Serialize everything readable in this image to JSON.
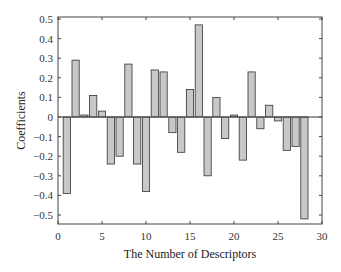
{
  "chart_data": {
    "type": "bar",
    "title": "",
    "xlabel": "The Number of Descriptors",
    "ylabel": "Coefficients",
    "xlim": [
      0,
      30
    ],
    "ylim": [
      -0.55,
      0.5
    ],
    "xticks": [
      0,
      5,
      10,
      15,
      20,
      25,
      30
    ],
    "yticks": [
      0.5,
      0.4,
      0.3,
      0.2,
      0.1,
      0,
      -0.1,
      -0.2,
      -0.3,
      -0.4,
      -0.5
    ],
    "ytick_labels": [
      "0.5",
      "0.4",
      "0.3",
      "0.2",
      "0.1",
      "0",
      "−0.1",
      "−0.2",
      "−0.3",
      "−0.4",
      "−0.5"
    ],
    "grid": false,
    "legend": null,
    "bar_color": "#c8c8c8",
    "bar_edge_color": "#333333",
    "x": [
      1,
      2,
      3,
      4,
      5,
      6,
      7,
      8,
      9,
      10,
      11,
      12,
      13,
      14,
      15,
      16,
      17,
      18,
      19,
      20,
      21,
      22,
      23,
      24,
      25,
      26,
      27,
      28
    ],
    "values": [
      -0.39,
      0.29,
      0.01,
      0.11,
      0.03,
      -0.24,
      -0.2,
      0.27,
      -0.24,
      -0.38,
      0.24,
      0.23,
      -0.08,
      -0.18,
      0.14,
      0.47,
      -0.3,
      0.1,
      -0.11,
      0.01,
      -0.22,
      0.23,
      -0.06,
      0.06,
      -0.02,
      -0.17,
      -0.15,
      -0.52
    ]
  }
}
